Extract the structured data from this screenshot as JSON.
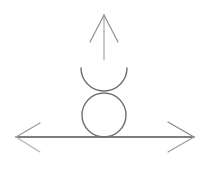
{
  "diagram": {
    "style": "hand-drawn pencil sketch",
    "colors": {
      "background": "#ffffff",
      "stroke_dark": "#555555",
      "stroke_light": "#9a9a9a"
    },
    "elements": [
      {
        "id": "horizontal-double-arrow",
        "type": "double-arrow",
        "from": [
          16,
          137
        ],
        "to": [
          194,
          137
        ]
      },
      {
        "id": "up-arrow",
        "type": "arrow",
        "from": [
          104,
          60
        ],
        "to": [
          104,
          15
        ]
      },
      {
        "id": "lower-circle",
        "type": "circle",
        "center": [
          104,
          115
        ],
        "radius": 22
      },
      {
        "id": "upper-cup-arc",
        "type": "arc",
        "center": [
          104,
          68
        ],
        "radius": 23,
        "portion": "bottom-half"
      }
    ]
  }
}
